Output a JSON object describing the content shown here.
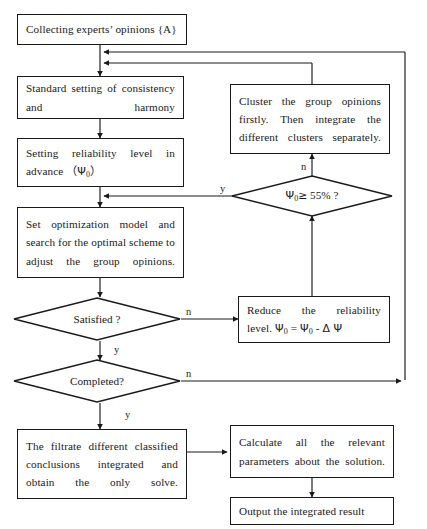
{
  "diagram": {
    "type": "flowchart",
    "background_color": "#ffffff",
    "stroke_color": "#1a1a1a"
  },
  "nodes": {
    "collect": {
      "id": "collect",
      "shape": "process",
      "text": "Collecting experts’ opinions {A}"
    },
    "standard": {
      "id": "standard",
      "shape": "process",
      "text": "Standard setting of consistency and harmony"
    },
    "setting_reliability": {
      "id": "setting_reliability",
      "shape": "process",
      "text_line1": "Setting reliability level in",
      "text_line2_pre": "advance （",
      "text_line2_sym": "Ψ",
      "text_line2_sub": "0",
      "text_line2_post": "）"
    },
    "optimization": {
      "id": "optimization",
      "shape": "process",
      "text": "Set optimization model and search for the optimal scheme to adjust the group opinions."
    },
    "satisfied": {
      "id": "satisfied",
      "shape": "decision",
      "text": "Satisfied ?"
    },
    "completed": {
      "id": "completed",
      "shape": "decision",
      "text": "Completed?"
    },
    "filtrate": {
      "id": "filtrate",
      "shape": "process",
      "text": "The filtrate different classified conclusions integrated and obtain the only solve."
    },
    "cluster": {
      "id": "cluster",
      "shape": "process",
      "text": "Cluster the group opinions firstly. Then integrate the different clusters separately."
    },
    "threshold": {
      "id": "threshold",
      "shape": "decision",
      "sym": "Ψ",
      "sub": "0",
      "op": "≥",
      "value": "55%",
      "q": "?"
    },
    "reduce": {
      "id": "reduce",
      "shape": "process",
      "line1": "Reduce the reliability",
      "line2_a": "level.  ",
      "line2_sym1": "Ψ",
      "line2_sub1": "0",
      "line2_eq": " = ",
      "line2_sym2": "Ψ",
      "line2_sub2": "0",
      "line2_minus": " - ",
      "line2_delta": "Δ",
      "line2_psi": " Ψ"
    },
    "calculate": {
      "id": "calculate",
      "shape": "process",
      "text": "Calculate all the relevant parameters about the solution."
    },
    "output": {
      "id": "output",
      "shape": "process",
      "text": "Output the integrated result"
    }
  },
  "edge_labels": {
    "threshold_yes": "y",
    "threshold_no": "n",
    "satisfied_no": "n",
    "satisfied_yes": "y",
    "completed_no": "n",
    "completed_yes": "y"
  }
}
